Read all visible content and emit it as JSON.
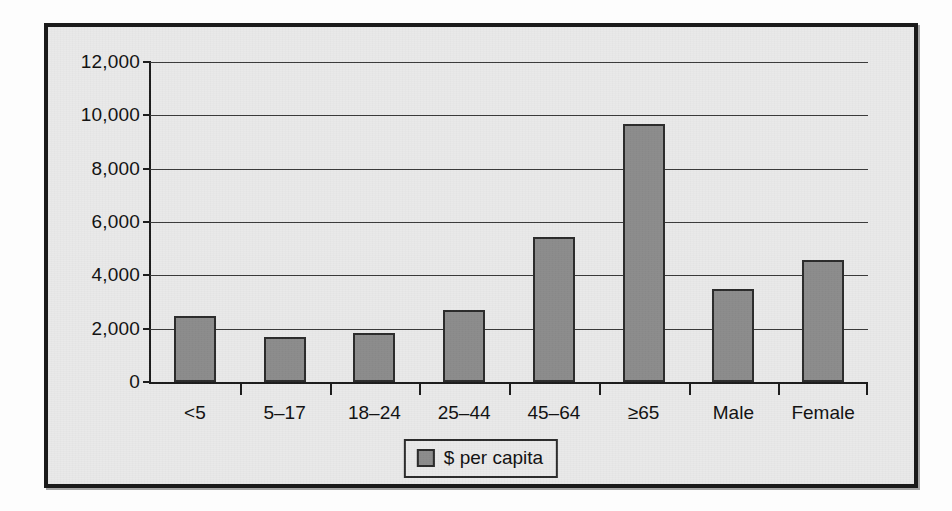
{
  "chart_data": {
    "type": "bar",
    "title": "",
    "xlabel": "",
    "ylabel": "",
    "categories": [
      "<5",
      "5–17",
      "18–24",
      "25–44",
      "45–64",
      "≥65",
      "Male",
      "Female"
    ],
    "values": [
      2480,
      1700,
      1820,
      2700,
      5450,
      9680,
      3500,
      4560
    ],
    "series": [
      {
        "name": "$ per capita",
        "values": [
          2480,
          1700,
          1820,
          2700,
          5450,
          9680,
          3500,
          4560
        ]
      }
    ],
    "ylim": [
      0,
      12000
    ],
    "ytick_values": [
      0,
      2000,
      4000,
      6000,
      8000,
      10000,
      12000
    ],
    "ytick_labels": [
      "0",
      "2,000",
      "4,000",
      "6,000",
      "8,000",
      "10,000",
      "12,000"
    ],
    "grid": true,
    "legend": {
      "position": "bottom-center",
      "entries": [
        {
          "label": "$ per capita",
          "color": "#8c8c8c"
        }
      ]
    },
    "colors": {
      "bar_fill": "#8c8c8c",
      "bar_outline": "#2b2b2b",
      "plot_background": "#e9e9e9",
      "frame": "#1b1b1b",
      "gridline": "#3a3a3a",
      "text": "#111111"
    }
  }
}
